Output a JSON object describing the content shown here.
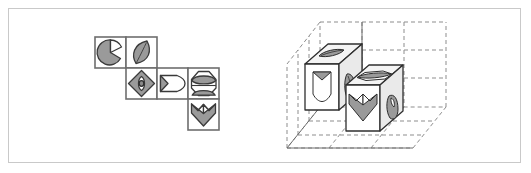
{
  "figure": {
    "title": "",
    "panels": [
      {
        "id": "net",
        "label": "cube-net"
      },
      {
        "id": "scene",
        "label": "isometric-cube-scene"
      }
    ]
  },
  "net": {
    "cell_size": 31,
    "origin": {
      "x": 95,
      "y": 37
    },
    "stroke_color": "#6e6e6e",
    "fill_color": "#ffffff",
    "cells": [
      {
        "name": "pac-wedge",
        "row": 0,
        "col": 0,
        "glyph": "pie-wedge-circle"
      },
      {
        "name": "leaf-lens",
        "row": 0,
        "col": 1,
        "glyph": "leaf-lens"
      },
      {
        "name": "diamond-eye",
        "row": 1,
        "col": 1,
        "glyph": "diamond-with-eye"
      },
      {
        "name": "bullet",
        "row": 1,
        "col": 2,
        "glyph": "bullet-arrow"
      },
      {
        "name": "hex-arc",
        "row": 1,
        "col": 3,
        "glyph": "hexagon-with-arc"
      },
      {
        "name": "heart-kite",
        "row": 2,
        "col": 3,
        "glyph": "heart-kite"
      }
    ]
  },
  "scene": {
    "grid": {
      "rows": 3,
      "cols": 3,
      "style": "dashed",
      "dash_color": "#8d8d8d",
      "solid_color": "#6f6f6f"
    },
    "cubes": [
      {
        "name": "cube-left",
        "cell": {
          "x": 1,
          "y": 1
        },
        "faces": {
          "top": "leaf-lens",
          "front": "bullet-arrow",
          "side": "leaf-lens"
        }
      },
      {
        "name": "cube-right",
        "cell": {
          "x": 2,
          "y": 1
        },
        "faces": {
          "top": "hexagon-with-arc",
          "front": "heart-kite",
          "side": "pie-wedge-circle"
        }
      }
    ]
  },
  "colors": {
    "border": "#c9c9c9",
    "glyph_fill": "#9a9a9a",
    "glyph_stroke": "#2e2e2e",
    "background": "#ffffff"
  }
}
